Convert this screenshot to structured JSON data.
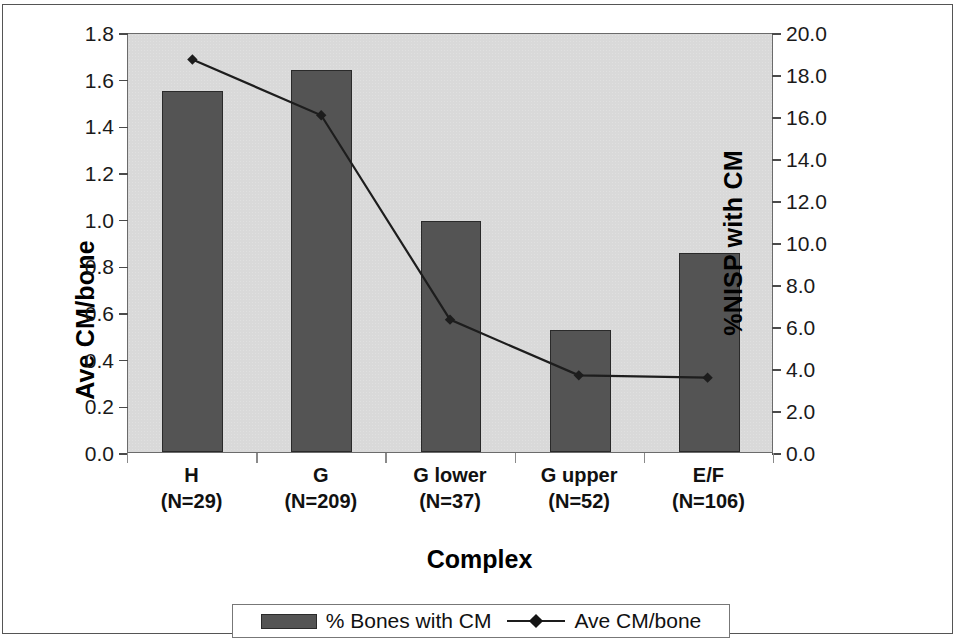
{
  "chart_data": {
    "type": "bar",
    "title": "",
    "xlabel": "Complex",
    "categories": [
      "H",
      "G",
      "G lower",
      "G upper",
      "E/F"
    ],
    "category_sublabels": [
      "(N=29)",
      "(N=209)",
      "(N=37)",
      "(N=52)",
      "(N=106)"
    ],
    "sample_sizes": [
      29,
      209,
      37,
      52,
      106
    ],
    "grid": false,
    "legend_position": "bottom",
    "axes": {
      "left": {
        "label": "Ave CM/bone",
        "min": 0.0,
        "max": 1.8,
        "step": 0.2,
        "ticks": [
          "0.0",
          "0.2",
          "0.4",
          "0.6",
          "0.8",
          "1.0",
          "1.2",
          "1.4",
          "1.6",
          "1.8"
        ]
      },
      "right": {
        "label": "%NISP with CM",
        "min": 0.0,
        "max": 20.0,
        "step": 2.0,
        "ticks": [
          "0.0",
          "2.0",
          "4.0",
          "6.0",
          "8.0",
          "10.0",
          "12.0",
          "14.0",
          "16.0",
          "18.0",
          "20.0"
        ]
      }
    },
    "series": [
      {
        "name": "% Bones with CM",
        "render": "bar",
        "axis": "right",
        "color": "#545454",
        "values": [
          17.2,
          18.2,
          11.0,
          5.8,
          9.5
        ]
      },
      {
        "name": "Ave CM/bone",
        "render": "line",
        "axis": "left",
        "color": "#1d1d1d",
        "marker": "diamond",
        "values": [
          1.69,
          1.45,
          0.57,
          0.33,
          0.32
        ]
      }
    ]
  },
  "legend": {
    "entries": [
      {
        "label": "% Bones with CM",
        "swatch": "bar-swatch"
      },
      {
        "label": "Ave CM/bone",
        "swatch": "line-diamond-swatch"
      }
    ]
  },
  "colors": {
    "bar_fill": "#545454",
    "bar_border": "#2a2a2a",
    "plot_background": "#d9d9d9",
    "line": "#1d1d1d",
    "frame": "#6b6b6b"
  }
}
